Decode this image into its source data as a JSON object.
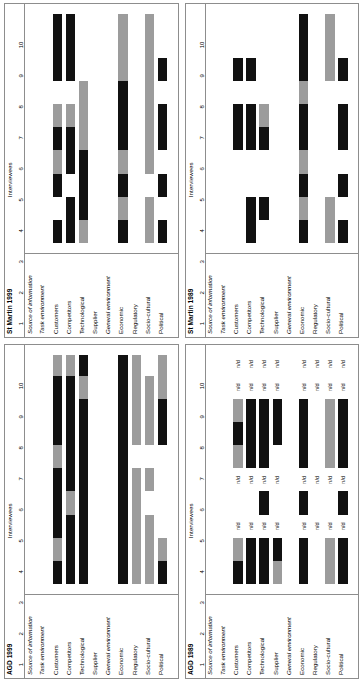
{
  "figure": {
    "rows_header": "Source of information",
    "columns_header": "Interviewees",
    "tick_labels": [
      "1",
      "2",
      "3",
      "4",
      "5",
      "6",
      "7",
      "8",
      "9",
      "10"
    ],
    "no_data_label": "n/d",
    "colors": {
      "black": "#111111",
      "grey": "#9c9c9c",
      "frame": "#8d8d8d",
      "background": "#ffffff"
    },
    "row_labels": [
      "Task environment",
      "Customers",
      "Competitors",
      "Technological",
      "Supplier",
      "General environment",
      "Economic",
      "Regulatory",
      "Socio-cultural",
      "Political"
    ],
    "group_rows": [
      0,
      5
    ]
  },
  "chart_data": [
    {
      "id": "agd-1999",
      "type": "bar",
      "title": "AGD 1999",
      "position": "top-left",
      "xlabel": "Interviewees",
      "ylabel": "Source of information",
      "xlim": [
        1,
        10
      ],
      "categories": [
        "Customers",
        "Competitors",
        "Technological",
        "Supplier",
        "Economic",
        "Regulatory",
        "Socio-cultural",
        "Political"
      ],
      "legend": [
        "black",
        "grey"
      ],
      "no_data_columns": [],
      "bars": [
        {
          "row": "Customers",
          "segments": [
            {
              "from": 1,
              "to": 2,
              "color": "black"
            },
            {
              "from": 2,
              "to": 3,
              "color": "grey"
            },
            {
              "from": 3,
              "to": 6,
              "color": "black"
            },
            {
              "from": 6,
              "to": 7,
              "color": "grey"
            },
            {
              "from": 7,
              "to": 10,
              "color": "black"
            },
            {
              "from": 10,
              "to": 10.9,
              "color": "grey"
            }
          ]
        },
        {
          "row": "Competitors",
          "segments": [
            {
              "from": 1,
              "to": 4,
              "color": "black"
            },
            {
              "from": 4,
              "to": 5,
              "color": "grey"
            },
            {
              "from": 5,
              "to": 10,
              "color": "black"
            },
            {
              "from": 10,
              "to": 10.9,
              "color": "grey"
            }
          ]
        },
        {
          "row": "Technological",
          "segments": [
            {
              "from": 1,
              "to": 5,
              "color": "black"
            },
            {
              "from": 5,
              "to": 9,
              "color": "black"
            },
            {
              "from": 9,
              "to": 10,
              "color": "grey"
            },
            {
              "from": 10,
              "to": 10.9,
              "color": "black"
            }
          ]
        },
        {
          "row": "Supplier",
          "segments": []
        },
        {
          "row": "Economic",
          "segments": [
            {
              "from": 1,
              "to": 10.9,
              "color": "black"
            }
          ]
        },
        {
          "row": "Regulatory",
          "segments": [
            {
              "from": 1,
              "to": 3,
              "color": "grey"
            },
            {
              "from": 3,
              "to": 4,
              "color": "grey"
            },
            {
              "from": 4,
              "to": 5,
              "color": "grey"
            },
            {
              "from": 5,
              "to": 6,
              "color": "grey"
            },
            {
              "from": 6,
              "to": 7,
              "color": "white"
            },
            {
              "from": 7,
              "to": 9,
              "color": "grey"
            },
            {
              "from": 9,
              "to": 10.9,
              "color": "grey"
            }
          ]
        },
        {
          "row": "Socio-cultural",
          "segments": [
            {
              "from": 1,
              "to": 3,
              "color": "grey"
            },
            {
              "from": 3,
              "to": 4,
              "color": "grey"
            },
            {
              "from": 5,
              "to": 6,
              "color": "grey"
            },
            {
              "from": 7,
              "to": 9,
              "color": "grey"
            },
            {
              "from": 9,
              "to": 10,
              "color": "grey"
            }
          ]
        },
        {
          "row": "Political",
          "segments": [
            {
              "from": 1,
              "to": 2,
              "color": "black"
            },
            {
              "from": 2,
              "to": 3,
              "color": "grey"
            },
            {
              "from": 7,
              "to": 9,
              "color": "black"
            },
            {
              "from": 9,
              "to": 10,
              "color": "grey"
            },
            {
              "from": 10,
              "to": 10.9,
              "color": "grey"
            }
          ]
        }
      ]
    },
    {
      "id": "st-martin-1999",
      "type": "bar",
      "title": "St Martin 1999",
      "position": "top-right",
      "xlabel": "Interviewees",
      "ylabel": "Source of information",
      "xlim": [
        1,
        10
      ],
      "categories": [
        "Customers",
        "Competitors",
        "Technological",
        "Supplier",
        "Economic",
        "Regulatory",
        "Socio-cultural",
        "Political"
      ],
      "legend": [
        "black",
        "grey"
      ],
      "no_data_columns": [],
      "bars": [
        {
          "row": "Customers",
          "segments": [
            {
              "from": 1,
              "to": 2,
              "color": "black"
            },
            {
              "from": 3,
              "to": 4,
              "color": "black"
            },
            {
              "from": 4,
              "to": 5,
              "color": "grey"
            },
            {
              "from": 5,
              "to": 6,
              "color": "black"
            },
            {
              "from": 6,
              "to": 7,
              "color": "grey"
            },
            {
              "from": 8,
              "to": 9,
              "color": "black"
            },
            {
              "from": 9,
              "to": 10.9,
              "color": "black"
            }
          ]
        },
        {
          "row": "Competitors",
          "segments": [
            {
              "from": 1,
              "to": 3,
              "color": "black"
            },
            {
              "from": 4,
              "to": 6,
              "color": "black"
            },
            {
              "from": 6,
              "to": 7,
              "color": "grey"
            },
            {
              "from": 8,
              "to": 9,
              "color": "black"
            },
            {
              "from": 9,
              "to": 10.9,
              "color": "black"
            }
          ]
        },
        {
          "row": "Technological",
          "segments": [
            {
              "from": 1,
              "to": 2,
              "color": "grey"
            },
            {
              "from": 2,
              "to": 5,
              "color": "black"
            },
            {
              "from": 5,
              "to": 7,
              "color": "grey"
            },
            {
              "from": 7,
              "to": 8,
              "color": "grey"
            }
          ]
        },
        {
          "row": "Supplier",
          "segments": []
        },
        {
          "row": "Economic",
          "segments": [
            {
              "from": 1,
              "to": 2,
              "color": "black"
            },
            {
              "from": 2,
              "to": 3,
              "color": "grey"
            },
            {
              "from": 3,
              "to": 4,
              "color": "black"
            },
            {
              "from": 4,
              "to": 5,
              "color": "grey"
            },
            {
              "from": 5,
              "to": 8,
              "color": "black"
            },
            {
              "from": 8,
              "to": 10.9,
              "color": "grey"
            }
          ]
        },
        {
          "row": "Regulatory",
          "segments": []
        },
        {
          "row": "Socio-cultural",
          "segments": [
            {
              "from": 1,
              "to": 3,
              "color": "grey"
            },
            {
              "from": 4,
              "to": 6,
              "color": "grey"
            },
            {
              "from": 6,
              "to": 7,
              "color": "grey"
            },
            {
              "from": 7,
              "to": 8,
              "color": "grey"
            },
            {
              "from": 8,
              "to": 10.9,
              "color": "grey"
            }
          ]
        },
        {
          "row": "Political",
          "segments": [
            {
              "from": 1,
              "to": 2,
              "color": "black"
            },
            {
              "from": 3,
              "to": 4,
              "color": "black"
            },
            {
              "from": 5,
              "to": 7,
              "color": "black"
            },
            {
              "from": 8,
              "to": 9,
              "color": "black"
            }
          ]
        }
      ]
    },
    {
      "id": "agd-1989",
      "type": "bar",
      "title": "AGD 1989",
      "position": "bottom-left",
      "xlabel": "Interviewees",
      "ylabel": "Source of information",
      "xlim": [
        1,
        10
      ],
      "categories": [
        "Customers",
        "Competitors",
        "Technological",
        "Supplier",
        "Economic",
        "Regulatory",
        "Socio-cultural",
        "Political"
      ],
      "legend": [
        "black",
        "grey"
      ],
      "no_data_columns": [
        3,
        5,
        9,
        10
      ],
      "bars": [
        {
          "row": "Customers",
          "segments": [
            {
              "from": 1,
              "to": 2,
              "color": "black"
            },
            {
              "from": 2,
              "to": 3,
              "color": "grey"
            },
            {
              "from": 6,
              "to": 7,
              "color": "grey"
            },
            {
              "from": 7,
              "to": 8,
              "color": "black"
            },
            {
              "from": 8,
              "to": 9,
              "color": "grey"
            }
          ]
        },
        {
          "row": "Competitors",
          "segments": [
            {
              "from": 1,
              "to": 3,
              "color": "black"
            },
            {
              "from": 6,
              "to": 9,
              "color": "black"
            }
          ]
        },
        {
          "row": "Technological",
          "segments": [
            {
              "from": 1,
              "to": 3,
              "color": "black"
            },
            {
              "from": 4,
              "to": 5,
              "color": "black"
            },
            {
              "from": 6,
              "to": 9,
              "color": "black"
            }
          ]
        },
        {
          "row": "Supplier",
          "segments": [
            {
              "from": 1,
              "to": 2,
              "color": "grey"
            },
            {
              "from": 2,
              "to": 3,
              "color": "black"
            },
            {
              "from": 7,
              "to": 9,
              "color": "black"
            }
          ]
        },
        {
          "row": "Economic",
          "segments": [
            {
              "from": 1,
              "to": 3,
              "color": "black"
            },
            {
              "from": 4,
              "to": 5,
              "color": "black"
            },
            {
              "from": 6,
              "to": 9,
              "color": "black"
            }
          ]
        },
        {
          "row": "Regulatory",
          "segments": []
        },
        {
          "row": "Socio-cultural",
          "segments": [
            {
              "from": 1,
              "to": 3,
              "color": "grey"
            },
            {
              "from": 6,
              "to": 9,
              "color": "grey"
            }
          ]
        },
        {
          "row": "Political",
          "segments": [
            {
              "from": 1,
              "to": 3,
              "color": "black"
            },
            {
              "from": 4,
              "to": 5,
              "color": "black"
            },
            {
              "from": 6,
              "to": 9,
              "color": "black"
            }
          ]
        }
      ]
    },
    {
      "id": "st-martin-1989",
      "type": "bar",
      "title": "St Martin 1989",
      "position": "bottom-right",
      "xlabel": "Interviewees",
      "ylabel": "Source of information",
      "xlim": [
        1,
        10
      ],
      "categories": [
        "Customers",
        "Competitors",
        "Technological",
        "Supplier",
        "Economic",
        "Regulatory",
        "Socio-cultural",
        "Political"
      ],
      "legend": [
        "black",
        "grey"
      ],
      "no_data_columns": [],
      "bars": [
        {
          "row": "Customers",
          "segments": [
            {
              "from": 5,
              "to": 7,
              "color": "black"
            },
            {
              "from": 8,
              "to": 9,
              "color": "black"
            }
          ]
        },
        {
          "row": "Competitors",
          "segments": [
            {
              "from": 1,
              "to": 3,
              "color": "black"
            },
            {
              "from": 5,
              "to": 7,
              "color": "black"
            },
            {
              "from": 8,
              "to": 9,
              "color": "black"
            }
          ]
        },
        {
          "row": "Technological",
          "segments": [
            {
              "from": 2,
              "to": 3,
              "color": "black"
            },
            {
              "from": 5,
              "to": 6,
              "color": "black"
            },
            {
              "from": 6,
              "to": 7,
              "color": "grey"
            }
          ]
        },
        {
          "row": "Supplier",
          "segments": []
        },
        {
          "row": "Economic",
          "segments": [
            {
              "from": 1,
              "to": 2,
              "color": "black"
            },
            {
              "from": 2,
              "to": 3,
              "color": "grey"
            },
            {
              "from": 3,
              "to": 4,
              "color": "black"
            },
            {
              "from": 4,
              "to": 5,
              "color": "grey"
            },
            {
              "from": 5,
              "to": 7,
              "color": "black"
            },
            {
              "from": 7,
              "to": 8,
              "color": "grey"
            },
            {
              "from": 8,
              "to": 10.9,
              "color": "black"
            }
          ]
        },
        {
          "row": "Regulatory",
          "segments": []
        },
        {
          "row": "Socio-cultural",
          "segments": [
            {
              "from": 1,
              "to": 3,
              "color": "grey"
            },
            {
              "from": 8,
              "to": 9,
              "color": "grey"
            },
            {
              "from": 9,
              "to": 10.9,
              "color": "grey"
            }
          ]
        },
        {
          "row": "Political",
          "segments": [
            {
              "from": 1,
              "to": 2,
              "color": "black"
            },
            {
              "from": 3,
              "to": 4,
              "color": "black"
            },
            {
              "from": 5,
              "to": 7,
              "color": "black"
            },
            {
              "from": 8,
              "to": 9,
              "color": "black"
            }
          ]
        }
      ]
    }
  ]
}
